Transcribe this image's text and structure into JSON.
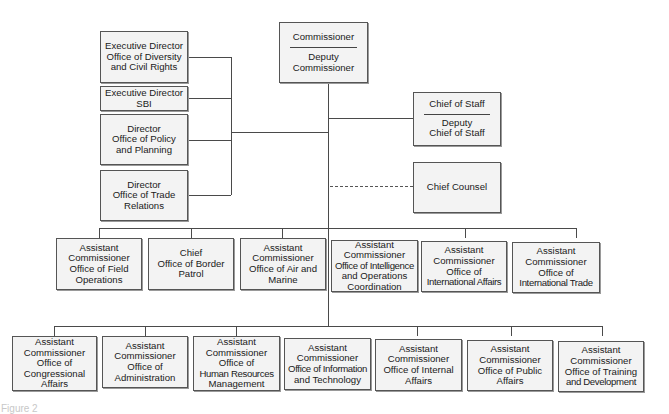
{
  "diagram": {
    "type": "org-chart",
    "top": {
      "title": "Commissioner",
      "subtitle_line1": "Deputy",
      "subtitle_line2": "Commissioner"
    },
    "staff_left": [
      {
        "lines": [
          "Executive Director",
          "Office of Diversity",
          "and Civil Rights"
        ]
      },
      {
        "lines": [
          "Executive Director",
          "SBI"
        ]
      },
      {
        "lines": [
          "Director",
          "Office of Policy",
          "and Planning"
        ]
      },
      {
        "lines": [
          "Director",
          "Office of Trade",
          "Relations"
        ]
      }
    ],
    "staff_right": {
      "chief_of_staff": {
        "title": "Chief of Staff",
        "sub_line1": "Deputy",
        "sub_line2": "Chief of Staff"
      },
      "chief_counsel": {
        "title": "Chief Counsel",
        "connection": "dashed"
      }
    },
    "row1": [
      {
        "lines": [
          "Assistant",
          "Commissioner",
          "Office of Field",
          "Operations"
        ]
      },
      {
        "lines": [
          "Chief",
          "Office of Border",
          "Patrol"
        ]
      },
      {
        "lines": [
          "Assistant",
          "Commissioner",
          "Office of Air and",
          "Marine"
        ]
      },
      {
        "lines": [
          "Assistant",
          "Commissioner",
          "Office of Intelligence",
          "and Operations",
          "Coordination"
        ]
      },
      {
        "lines": [
          "Assistant",
          "Commissioner",
          "Office of",
          "International Affairs"
        ]
      },
      {
        "lines": [
          "Assistant",
          "Commissioner",
          "Office of",
          "International Trade"
        ]
      }
    ],
    "row2": [
      {
        "lines": [
          "Assistant",
          "Commissioner",
          "Office of",
          "Congressional",
          "Affairs"
        ]
      },
      {
        "lines": [
          "Assistant",
          "Commissioner",
          "Office of",
          "Administration"
        ]
      },
      {
        "lines": [
          "Assistant",
          "Commissioner",
          "Office of",
          "Human Resources",
          "Management"
        ]
      },
      {
        "lines": [
          "Assistant",
          "Commissioner",
          "Office of Information",
          "and Technology"
        ]
      },
      {
        "lines": [
          "Assistant",
          "Commissioner",
          "Office of Internal",
          "Affairs"
        ]
      },
      {
        "lines": [
          "Assistant",
          "Commissioner",
          "Office of Public",
          "Affairs"
        ]
      },
      {
        "lines": [
          "Assistant",
          "Commissioner",
          "Office of Training",
          "and Development"
        ]
      }
    ],
    "caption": "Figure 2"
  }
}
